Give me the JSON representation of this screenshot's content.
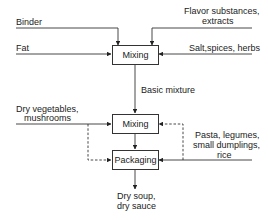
{
  "diagram": {
    "nodes": {
      "mixing_1": "Mixing",
      "mixing_2": "Mixing",
      "packaging": "Packaging"
    },
    "inputs": {
      "binder": "Binder",
      "fat": "Fat",
      "flavor_line1": "Flavor substances,",
      "flavor_line2": "extracts",
      "salt": "Salt,spices, herbs",
      "dry_veg_line1": "Dry vegetables,",
      "dry_veg_line2": "mushrooms",
      "pasta_line1": "Pasta, legumes,",
      "pasta_line2": "small dumplings,",
      "pasta_line3": "rice"
    },
    "edges": {
      "basic_mixture": "Basic mixture"
    },
    "outputs": {
      "product_line1": "Dry soup,",
      "product_line2": "dry sauce"
    }
  }
}
